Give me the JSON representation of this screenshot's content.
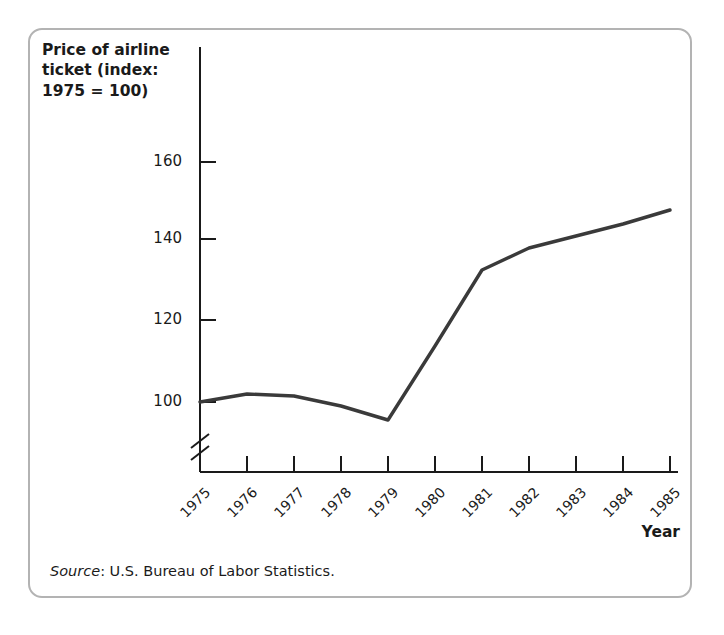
{
  "figure": {
    "y_axis_title": "Price of airline\nticket (index:\n1975 = 100)",
    "x_axis_title": "Year",
    "source_lead": "Source",
    "source_text": ": U.S. Bureau of Labor Statistics.",
    "line_color": "#3a3a3a",
    "axis_color": "#1a1a1a",
    "border_color": "#b3b3b3",
    "background_color": "#ffffff"
  },
  "chart_data": {
    "type": "line",
    "title": "Price of airline ticket (index: 1975 = 100)",
    "xlabel": "Year",
    "ylabel": "Price of airline ticket (index: 1975 = 100)",
    "x": [
      1975,
      1976,
      1977,
      1978,
      1979,
      1980,
      1981,
      1982,
      1983,
      1984,
      1985
    ],
    "values": [
      100,
      102,
      101.5,
      99,
      95.5,
      114,
      133,
      138.5,
      141.5,
      144.5,
      148
    ],
    "xtick_labels": [
      "1975",
      "1976",
      "1977",
      "1978",
      "1979",
      "1980",
      "1981",
      "1982",
      "1983",
      "1984",
      "1985"
    ],
    "ytick_labels": [
      "100",
      "120",
      "140",
      "160"
    ],
    "yticks": [
      100,
      120,
      140,
      160
    ],
    "ylim": [
      92,
      166
    ],
    "xlim": [
      1975,
      1985
    ],
    "axis_break": true,
    "grid": false,
    "legend": null,
    "series_name": "Price of airline ticket (index: 1975 = 100)",
    "source": "Source: U.S. Bureau of Labor Statistics."
  }
}
